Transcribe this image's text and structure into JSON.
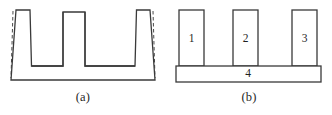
{
  "figure": {
    "panels": [
      {
        "id": "a",
        "caption": "(a)",
        "description": "one-piece comb-shaped cross-section with dashed springback outlines on outer legs",
        "part_labels": []
      },
      {
        "id": "b",
        "caption": "(b)",
        "description": "assembled version built from four separate pieces",
        "part_labels": [
          {
            "text": "1",
            "role": "left-rib"
          },
          {
            "text": "2",
            "role": "middle-rib"
          },
          {
            "text": "3",
            "role": "right-rib"
          },
          {
            "text": "4",
            "role": "base-plate"
          }
        ]
      }
    ]
  },
  "style": {
    "line_color": "#3a3a3a",
    "dashed_color": "#4a4a4a",
    "background": "#ffffff",
    "text_color": "#1f1f1f"
  }
}
